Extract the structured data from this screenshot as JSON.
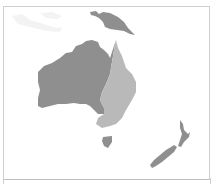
{
  "header": {
    "title": ""
  },
  "map": {
    "region": "Oceania",
    "colors": {
      "background": "#ffffff",
      "frame_border": "#cfcfcf",
      "dark_region": "#8f8f8f",
      "light_region": "#b9b9b9",
      "faint_region": "#f3f3f3"
    },
    "regions": [
      {
        "name": "Western Australia / Central",
        "shade": "dark"
      },
      {
        "name": "Eastern Australia",
        "shade": "light"
      },
      {
        "name": "Papua New Guinea",
        "shade": "dark"
      },
      {
        "name": "Tasmania",
        "shade": "dark"
      },
      {
        "name": "New Zealand",
        "shade": "dark"
      },
      {
        "name": "Indonesia",
        "shade": "faint"
      }
    ]
  }
}
